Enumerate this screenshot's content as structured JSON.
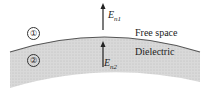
{
  "diagram": {
    "regions": [
      {
        "id": "1",
        "symbol": "①",
        "label": "Free space"
      },
      {
        "id": "2",
        "symbol": "②",
        "label": "Dielectric"
      }
    ],
    "vectors": [
      {
        "base": "E",
        "sub": "n1"
      },
      {
        "base": "E",
        "sub": "n2"
      }
    ],
    "colors": {
      "dielectric_fill": "#d4d4d4",
      "boundary": "#555555",
      "arrow": "#222222"
    }
  }
}
